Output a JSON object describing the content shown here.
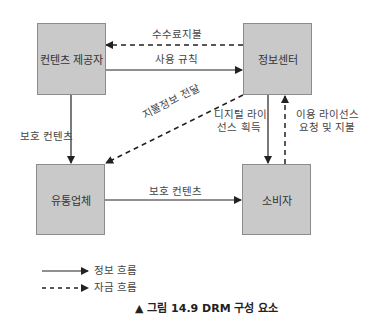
{
  "nodes": {
    "provider": "컨텐츠 제공자",
    "clearinghouse": "정보센터",
    "distributor": "유통업체",
    "consumer": "소비자"
  },
  "edges": {
    "fee_payment": "수수료지불",
    "usage_rules": "사용 규칙",
    "payment_info": "지불정보 전달",
    "protected_content_down": "보호 컨텐츠",
    "protected_content_right": "보호 컨텐츠",
    "license_acquire_line1": "디지털 라이",
    "license_acquire_line2": "선스 획득",
    "license_request_line1": "이용 라이선스",
    "license_request_line2": "요청 및 지불"
  },
  "legend": {
    "info_flow": "정보 흐름",
    "money_flow": "자금 흐름"
  },
  "caption": "▲ 그림 14.9 DRM 구성 요소",
  "colors": {
    "box_fill": "#c9c9c9",
    "box_border": "#8c8c8c",
    "line": "#222222"
  }
}
